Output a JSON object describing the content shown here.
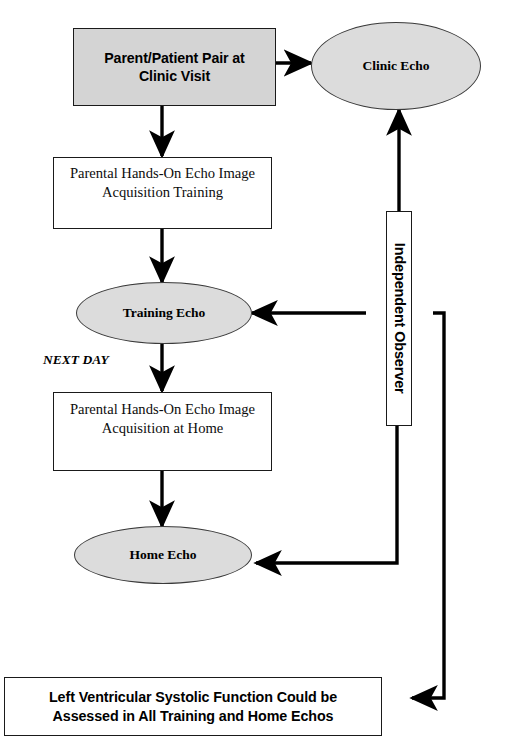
{
  "diagram": {
    "title_present": false,
    "colors": {
      "shaded_box_fill": "#d4d4d4",
      "ellipse_fill": "#dcdcdc",
      "stroke": "#000000",
      "white_fill": "#ffffff"
    },
    "nodes": [
      {
        "id": "clinic-visit",
        "shape": "rectangle",
        "fill": "shaded",
        "lines": [
          "Parent/Patient Pair at",
          "Clinic Visit"
        ],
        "text": "Parent/Patient Pair at Clinic Visit"
      },
      {
        "id": "clinic-echo",
        "shape": "ellipse",
        "fill": "gray",
        "text": "Clinic Echo"
      },
      {
        "id": "training-acquisition",
        "shape": "rectangle",
        "fill": "white",
        "lines": [
          "Parental Hands-On Echo Image",
          "Acquisition Training"
        ],
        "text": "Parental Hands-On Echo Image Acquisition Training"
      },
      {
        "id": "training-echo",
        "shape": "ellipse",
        "fill": "gray",
        "text": "Training Echo"
      },
      {
        "id": "home-acquisition",
        "shape": "rectangle",
        "fill": "white",
        "lines": [
          "Parental Hands-On Echo Image",
          "Acquisition at Home"
        ],
        "text": "Parental Hands-On Echo Image Acquisition at Home"
      },
      {
        "id": "home-echo",
        "shape": "ellipse",
        "fill": "gray",
        "text": "Home Echo"
      },
      {
        "id": "independent-observer",
        "shape": "rectangle-vertical",
        "fill": "white",
        "text": "Independent Observer"
      },
      {
        "id": "outcome",
        "shape": "rectangle",
        "fill": "white",
        "lines": [
          "Left Ventricular Systolic Function Could be",
          "Assessed in All Training and Home Echos"
        ],
        "text": "Left Ventricular Systolic Function Could be Assessed in All Training and Home Echos"
      }
    ],
    "annotations": [
      {
        "id": "next-day",
        "text": "NEXT DAY"
      }
    ],
    "edges": [
      {
        "from": "clinic-visit",
        "to": "clinic-echo",
        "kind": "arrow-right"
      },
      {
        "from": "clinic-visit",
        "to": "training-acquisition",
        "kind": "arrow-down"
      },
      {
        "from": "training-acquisition",
        "to": "training-echo",
        "kind": "arrow-down"
      },
      {
        "from": "training-echo",
        "to": "home-acquisition",
        "kind": "arrow-down"
      },
      {
        "from": "home-acquisition",
        "to": "home-echo",
        "kind": "arrow-down"
      },
      {
        "from": "independent-observer",
        "to": "clinic-echo",
        "kind": "arrow-up"
      },
      {
        "from": "independent-observer",
        "to": "training-echo",
        "kind": "arrow-left"
      },
      {
        "from": "independent-observer",
        "to": "home-echo",
        "kind": "arrow-left-elbow"
      },
      {
        "from": "independent-observer",
        "to": "outcome",
        "kind": "arrow-left-elbow"
      }
    ]
  }
}
